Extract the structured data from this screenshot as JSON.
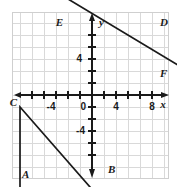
{
  "figure": {
    "background_color": "#ffffff",
    "grid_color": "#d9d9d9",
    "axis_color": "#1a1a1a",
    "frame_color": "#cfcfcf"
  },
  "axes": {
    "x_label": "x",
    "y_label": "y",
    "origin_label": "0",
    "x_ticks": [
      {
        "value": -4,
        "label": "-4"
      },
      {
        "value": 4,
        "label": "4"
      },
      {
        "value": 8,
        "label": "8"
      }
    ],
    "y_ticks": [
      {
        "value": 4,
        "label": "4"
      },
      {
        "value": -4,
        "label": "-4"
      }
    ],
    "x_range": [
      -7,
      9
    ],
    "y_range": [
      -10,
      9
    ]
  },
  "chart_data": {
    "type": "scatter",
    "xlabel": "x",
    "ylabel": "y",
    "xlim": [
      -7,
      9
    ],
    "ylim": [
      -10,
      9
    ],
    "grid": true,
    "legend": "none",
    "xticks": [
      -4,
      4,
      8
    ],
    "yticks": [
      4,
      -4
    ],
    "points": [
      {
        "name": "E",
        "x": -2,
        "y": 8
      },
      {
        "name": "D",
        "x": 8,
        "y": 8
      },
      {
        "name": "F",
        "x": 8,
        "y": 2
      },
      {
        "name": "C",
        "x": -6,
        "y": -1
      },
      {
        "name": "A",
        "x": -6,
        "y": -9
      },
      {
        "name": "B",
        "x": 1,
        "y": -9
      }
    ],
    "shapes": [
      {
        "name": "triangle-EDF",
        "kind": "triangle",
        "vertices": [
          "E",
          "D",
          "F"
        ],
        "coordinates": [
          [
            -2,
            8
          ],
          [
            8,
            8
          ],
          [
            8,
            2
          ]
        ]
      },
      {
        "name": "triangle-CAB",
        "kind": "triangle",
        "vertices": [
          "C",
          "A",
          "B"
        ],
        "coordinates": [
          [
            -6,
            -1
          ],
          [
            -6,
            -9
          ],
          [
            1,
            -9
          ]
        ]
      }
    ]
  },
  "labels": {
    "E": "E",
    "D": "D",
    "F": "F",
    "C": "C",
    "A": "A",
    "B": "B"
  }
}
